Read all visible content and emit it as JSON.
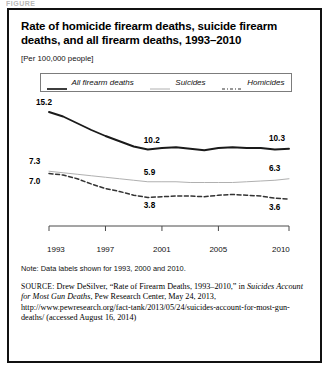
{
  "figure_label": "FIGURE",
  "title": "Rate of homicide firearm deaths, suicide firearm deaths, and all firearm deaths, 1993–2010",
  "subtitle": "[Per 100,000 people]",
  "legend": {
    "items": [
      {
        "label": "All firearm deaths",
        "style": "solid-dark",
        "color": "#1a1a1a"
      },
      {
        "label": "Suicides",
        "style": "solid-light",
        "color": "#b0b0b0"
      },
      {
        "label": "Homicides",
        "style": "dash-dot",
        "color": "#333333"
      }
    ]
  },
  "note": "Note: Data labels shown for 1993, 2000 and 2010.",
  "source": {
    "prefix": "SOURCE:",
    "part1": " Drew DeSilver, “Rate of Firearm Deaths, 1993–2010,” in ",
    "italic": "Suicides Account for Most Gun Deaths",
    "part2": ", Pew Research Center, May 24, 2013, http://www.pewresearch.org/fact-tank/2013/05/24/suicides-account-for-most-gun-deaths/ (accessed August 16, 2014)"
  },
  "chart_data": {
    "type": "line",
    "title": "Rate of homicide firearm deaths, suicide firearm deaths, and all firearm deaths, 1993–2010",
    "ylabel": "Per 100,000 people",
    "xlabel": "",
    "grid": false,
    "legend_position": "top-center",
    "x": [
      1993,
      1994,
      1995,
      1996,
      1997,
      1998,
      1999,
      2000,
      2001,
      2002,
      2003,
      2004,
      2005,
      2006,
      2007,
      2008,
      2009,
      2010
    ],
    "xticks": [
      "1993",
      "1997",
      "2001",
      "2005",
      "2010"
    ],
    "xtick_values": [
      1993,
      1997,
      2001,
      2005,
      2010
    ],
    "xlim": [
      1993,
      2010
    ],
    "ylim": [
      0,
      16
    ],
    "series": [
      {
        "name": "All firearm deaths",
        "color": "#1a1a1a",
        "style": "solid-dark",
        "values": [
          15.2,
          14.6,
          13.7,
          12.8,
          12.0,
          11.3,
          10.6,
          10.2,
          10.4,
          10.5,
          10.3,
          10.1,
          10.4,
          10.5,
          10.4,
          10.4,
          10.2,
          10.3
        ],
        "labels": [
          {
            "x": 1993,
            "value": 15.2
          },
          {
            "x": 2000,
            "value": 10.2
          },
          {
            "x": 2010,
            "value": 10.3
          }
        ]
      },
      {
        "name": "Suicides",
        "color": "#b0b0b0",
        "style": "solid-light",
        "values": [
          7.3,
          7.1,
          6.9,
          6.7,
          6.5,
          6.3,
          6.1,
          5.9,
          5.9,
          5.9,
          5.8,
          5.8,
          5.8,
          5.8,
          5.9,
          6.0,
          6.1,
          6.3
        ],
        "labels": [
          {
            "x": 1993,
            "value": 7.3
          },
          {
            "x": 2000,
            "value": 5.9
          },
          {
            "x": 2010,
            "value": 6.3
          }
        ]
      },
      {
        "name": "Homicides",
        "color": "#333333",
        "style": "dash-dot",
        "values": [
          7.0,
          6.8,
          6.3,
          5.6,
          5.0,
          4.6,
          4.1,
          3.8,
          3.9,
          4.0,
          4.0,
          3.9,
          4.1,
          4.2,
          4.1,
          4.0,
          3.7,
          3.6
        ],
        "labels": [
          {
            "x": 1993,
            "value": 7.0
          },
          {
            "x": 2000,
            "value": 3.8
          },
          {
            "x": 2010,
            "value": 3.6
          }
        ]
      }
    ]
  }
}
